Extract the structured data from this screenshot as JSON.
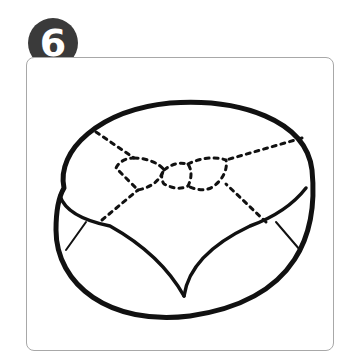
{
  "step": {
    "number": "6",
    "badge_color": "#3a3a3a",
    "text_color": "#ffffff"
  },
  "frame": {
    "border_color": "#a8a8a8"
  },
  "illustration": {
    "subject": "cushion-pouf-with-dotted-seam-bow",
    "stroke_color": "#111111"
  }
}
